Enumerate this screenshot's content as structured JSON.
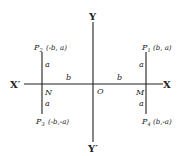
{
  "diagram": {
    "axes": {
      "x_positive": "X",
      "x_negative": "X′",
      "y_positive": "Y",
      "y_negative": "Y′",
      "origin": "O"
    },
    "feet": {
      "left": "N",
      "right": "M"
    },
    "points": {
      "p1": {
        "name": "P",
        "sub": "1",
        "coords": "(b, a)"
      },
      "p2": {
        "name": "P",
        "sub": "2",
        "coords": "(-b, a)"
      },
      "p3": {
        "name": "P",
        "sub": "3",
        "coords": "(-b,-a)"
      },
      "p4": {
        "name": "P",
        "sub": "4",
        "coords": "(b,-a)"
      }
    },
    "segments": {
      "a_upper_left": "a",
      "a_lower_left": "a",
      "a_upper_right": "a",
      "a_lower_right": "a",
      "b_left": "b",
      "b_right": "b"
    }
  }
}
